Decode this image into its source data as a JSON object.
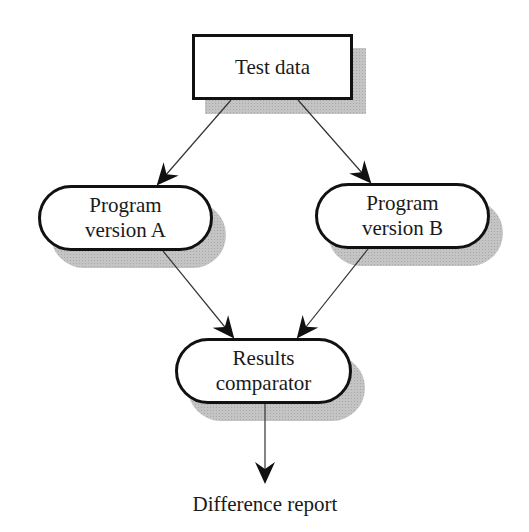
{
  "diagram": {
    "type": "flowchart",
    "nodes": [
      {
        "id": "test_data",
        "shape": "rectangle",
        "lines": [
          "Test data"
        ]
      },
      {
        "id": "program_a",
        "shape": "rounded",
        "lines": [
          "Program",
          "version A"
        ]
      },
      {
        "id": "program_b",
        "shape": "rounded",
        "lines": [
          "Program",
          "version B"
        ]
      },
      {
        "id": "comparator",
        "shape": "rounded",
        "lines": [
          "Results",
          "comparator"
        ]
      }
    ],
    "output_label": "Difference report",
    "edges": [
      {
        "from": "test_data",
        "to": "program_a"
      },
      {
        "from": "test_data",
        "to": "program_b"
      },
      {
        "from": "program_a",
        "to": "comparator"
      },
      {
        "from": "program_b",
        "to": "comparator"
      },
      {
        "from": "comparator",
        "to": "difference_report"
      }
    ]
  }
}
